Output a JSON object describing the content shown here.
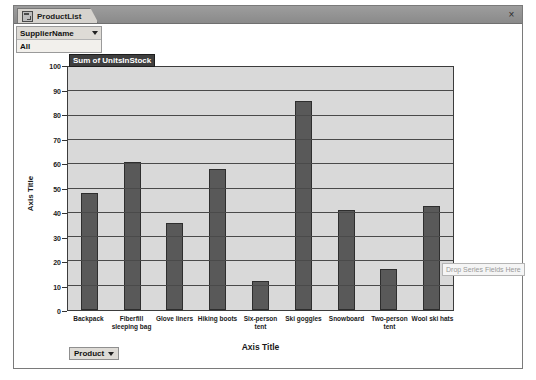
{
  "window": {
    "tab_label": "ProductList",
    "tab_icon": "form-datasheet-icon",
    "close_label": "×"
  },
  "filter": {
    "field_name": "SupplierName",
    "selected_value": "All",
    "caret_icon": "chevron-down-icon"
  },
  "value_field": {
    "caption": "Sum of UnitsInStock"
  },
  "series_drop_zone": {
    "label": "Drop Series Fields Here"
  },
  "category_field": {
    "label": "Product",
    "caret_icon": "chevron-down-icon"
  },
  "colors": {
    "bar_fill": "#595959",
    "bar_border": "#2e2e2e",
    "plot_background": "#d9d9d9",
    "gridline": "#4a4a4a",
    "titlebar": "#8a8a8a",
    "selected_caption_bg": "#3f3f3f"
  },
  "chart_data": {
    "type": "bar",
    "title": "Sum of UnitsInStock",
    "xlabel": "Axis Title",
    "ylabel": "Axis Title",
    "ylim": [
      0,
      100
    ],
    "yticks": [
      0,
      10,
      20,
      30,
      40,
      50,
      60,
      70,
      80,
      90,
      100
    ],
    "grid": true,
    "legend": false,
    "categories": [
      "Backpack",
      "Fiberfill sleeping bag",
      "Glove liners",
      "Hiking boots",
      "Six-person tent",
      "Ski goggles",
      "Snowboard",
      "Two-person tent",
      "Wool ski hats"
    ],
    "values": [
      48,
      61,
      36,
      58,
      12,
      86,
      41,
      17,
      43
    ]
  }
}
